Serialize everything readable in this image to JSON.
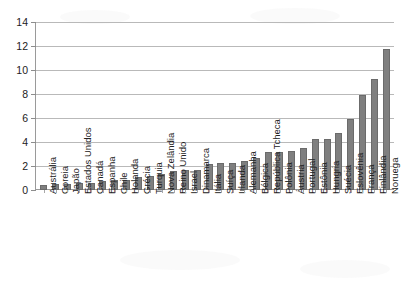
{
  "chart_data": {
    "type": "bar",
    "title": "",
    "subtitle": "",
    "xlabel": "",
    "ylabel": "",
    "ylim": [
      0,
      14
    ],
    "yticks": [
      0,
      2,
      4,
      6,
      8,
      10,
      12,
      14
    ],
    "ytick_labels": [
      "0",
      "2",
      "4",
      "6",
      "8",
      "10",
      "12",
      "14"
    ],
    "grid": true,
    "legend": false,
    "legend_position": "none",
    "bar_color": "#7f7f7f",
    "bar_edge_color": "#6b6b6b",
    "gridline_color": "#b9b9b9",
    "axis_color": "#9a9a9a",
    "categories": [
      "Austrália",
      "Coreia",
      "Japão",
      "Estados Unidos",
      "Canadá",
      "Espanha",
      "Chile",
      "Holanda",
      "Grécia",
      "Turquia",
      "Nova Zelândia",
      "Reino Unido",
      "Israel",
      "Dinamarca",
      "Itália",
      "Suíça",
      "Irlanda",
      "Alemanha",
      "Bélgica",
      "República Tcheca",
      "Polônia",
      "Áustria",
      "Portugal",
      "Estônia",
      "Hungria",
      "Suécia",
      "Eslovênia",
      "França",
      "Finlândia",
      "Noruega"
    ],
    "values": [
      0.4,
      0.5,
      0.5,
      0.55,
      0.55,
      0.75,
      0.8,
      0.8,
      1.1,
      1.15,
      1.35,
      1.6,
      1.65,
      1.7,
      2.2,
      2.3,
      2.3,
      2.4,
      2.65,
      3.15,
      3.15,
      3.25,
      3.55,
      4.3,
      4.3,
      4.8,
      5.95,
      7.95,
      9.3,
      11.85
    ]
  }
}
